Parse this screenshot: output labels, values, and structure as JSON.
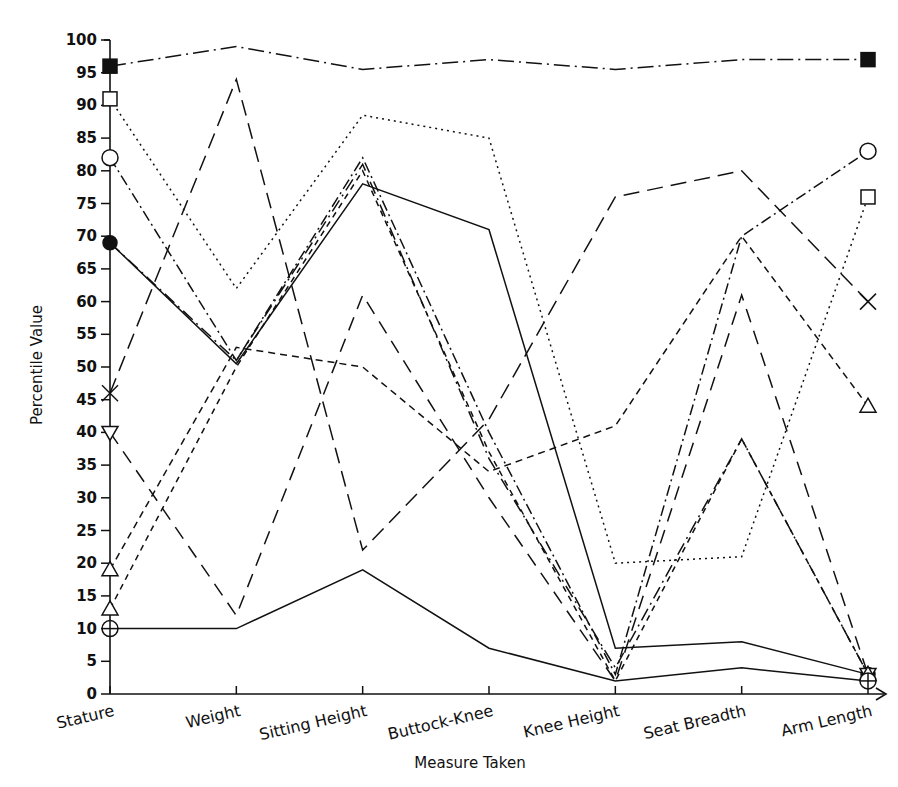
{
  "chart_data": {
    "type": "line",
    "title": "",
    "xlabel": "Measure Taken",
    "ylabel": "Percentile Value",
    "categories": [
      "Stature",
      "Weight",
      "Sitting Height",
      "Buttock-Knee",
      "Knee Height",
      "Seat Breadth",
      "Arm Length"
    ],
    "ylim": [
      0,
      100
    ],
    "yticks": [
      0,
      5,
      10,
      15,
      20,
      25,
      30,
      35,
      40,
      45,
      50,
      55,
      60,
      65,
      70,
      75,
      80,
      85,
      90,
      95,
      100
    ],
    "grid": false,
    "legend": "none",
    "series": [
      {
        "name": "subject-1",
        "marker": "filled-square",
        "dash": "dash-dot",
        "values": [
          96,
          99,
          95.5,
          97,
          95.5,
          97,
          97
        ]
      },
      {
        "name": "subject-2",
        "marker": "open-square",
        "dash": "dotted",
        "values": [
          91,
          62,
          88.5,
          85,
          20,
          21,
          76
        ]
      },
      {
        "name": "subject-3",
        "marker": "open-circle",
        "dash": "dash-dot-fine",
        "values": [
          82,
          51,
          82,
          40,
          3,
          70,
          83
        ]
      },
      {
        "name": "subject-4",
        "marker": "filled-circle",
        "dash": "solid",
        "values": [
          69,
          50.5,
          78,
          71,
          7,
          8,
          3
        ]
      },
      {
        "name": "subject-5",
        "marker": "x-mark",
        "dash": "long-dash",
        "values": [
          46,
          94,
          22,
          42,
          76,
          80,
          60
        ]
      },
      {
        "name": "subject-6",
        "marker": "down-triangle",
        "dash": "long-dash-b",
        "values": [
          40,
          12,
          61,
          30,
          2,
          61,
          3
        ]
      },
      {
        "name": "subject-7",
        "marker": "open-triangle",
        "dash": "short-dash",
        "values": [
          19,
          53,
          50,
          34,
          41,
          70,
          44
        ]
      },
      {
        "name": "subject-8",
        "marker": "open-triangle-b",
        "dash": "short-dash-b",
        "values": [
          13,
          50,
          80,
          37,
          2,
          39,
          3
        ]
      },
      {
        "name": "subject-9",
        "marker": "crossed-circle",
        "dash": "solid-b",
        "values": [
          10,
          10,
          19,
          7,
          2,
          4,
          2
        ]
      },
      {
        "name": "subject-10",
        "marker": "none",
        "dash": "dash-dot-b",
        "values": [
          69,
          51,
          81,
          36,
          4,
          39,
          3
        ]
      }
    ]
  },
  "axis": {
    "y_label_text": "Percentile Value",
    "x_label_text": "Measure Taken",
    "y_tick_text": [
      "0",
      "5",
      "10",
      "15",
      "20",
      "25",
      "30",
      "35",
      "40",
      "45",
      "50",
      "55",
      "60",
      "65",
      "70",
      "75",
      "80",
      "85",
      "90",
      "95",
      "100"
    ],
    "x_tick_text": [
      "Stature",
      "Weight",
      "Sitting Height",
      "Buttock-Knee",
      "Knee Height",
      "Seat Breadth",
      "Arm Length"
    ]
  },
  "colors": {
    "ink": "#111111",
    "background": "#ffffff"
  }
}
